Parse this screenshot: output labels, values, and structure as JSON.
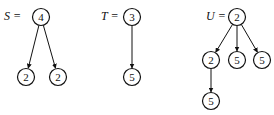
{
  "trees": [
    {
      "name": "S",
      "label": "S =",
      "label_pos": [
        4,
        20
      ],
      "nodes": [
        {
          "id": "s0",
          "value": "4",
          "x": 41,
          "y": 17
        },
        {
          "id": "s1",
          "value": "2",
          "x": 26,
          "y": 77
        },
        {
          "id": "s2",
          "value": "2",
          "x": 58,
          "y": 77
        }
      ],
      "edges": [
        [
          "s0",
          "s1"
        ],
        [
          "s0",
          "s2"
        ]
      ]
    },
    {
      "name": "T",
      "label": "T =",
      "label_pos": [
        101,
        20
      ],
      "nodes": [
        {
          "id": "t0",
          "value": "3",
          "x": 132,
          "y": 17
        },
        {
          "id": "t1",
          "value": "5",
          "x": 132,
          "y": 77
        }
      ],
      "edges": [
        [
          "t0",
          "t1"
        ]
      ]
    },
    {
      "name": "U",
      "label": "U =",
      "label_pos": [
        206,
        20
      ],
      "nodes": [
        {
          "id": "u0",
          "value": "2",
          "x": 237,
          "y": 17
        },
        {
          "id": "u1",
          "value": "2",
          "x": 211,
          "y": 60
        },
        {
          "id": "u2",
          "value": "5",
          "x": 237,
          "y": 60
        },
        {
          "id": "u3",
          "value": "5",
          "x": 262,
          "y": 60
        },
        {
          "id": "u4",
          "value": "5",
          "x": 211,
          "y": 101
        }
      ],
      "edges": [
        [
          "u0",
          "u1"
        ],
        [
          "u0",
          "u2"
        ],
        [
          "u0",
          "u3"
        ],
        [
          "u1",
          "u4"
        ]
      ]
    }
  ],
  "node_radius": 8.5
}
